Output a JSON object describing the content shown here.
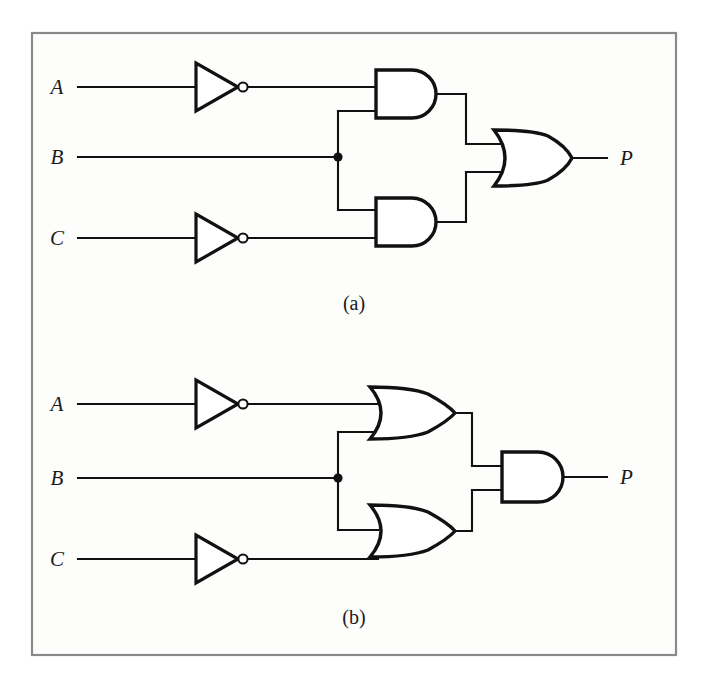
{
  "figure": {
    "background_color": "#ffffff",
    "frame_color": "#8a8a8a",
    "wire_color": "#111111",
    "gate_fill": "#ffffff"
  },
  "circuits": [
    {
      "id": "circuit-a",
      "caption": "(a)",
      "description": "Two AND gates feeding an OR gate",
      "inputs": [
        {
          "label": "A",
          "inverted": true
        },
        {
          "label": "B",
          "inverted": false
        },
        {
          "label": "C",
          "inverted": true
        }
      ],
      "output": {
        "label": "P"
      },
      "gates": [
        {
          "type": "NOT",
          "name": "inverter-a",
          "input": "A",
          "output": "not-A"
        },
        {
          "type": "NOT",
          "name": "inverter-c",
          "input": "C",
          "output": "not-C"
        },
        {
          "type": "AND",
          "name": "and-gate-top",
          "inputs": [
            "not-A",
            "B"
          ]
        },
        {
          "type": "AND",
          "name": "and-gate-bottom",
          "inputs": [
            "B",
            "not-C"
          ]
        },
        {
          "type": "OR",
          "name": "or-gate-output",
          "inputs": [
            "and-gate-top",
            "and-gate-bottom"
          ],
          "output": "P"
        }
      ],
      "expression": "P = (A' · B) + (B · C')"
    },
    {
      "id": "circuit-b",
      "caption": "(b)",
      "description": "Two OR gates feeding an AND gate",
      "inputs": [
        {
          "label": "A",
          "inverted": true
        },
        {
          "label": "B",
          "inverted": false
        },
        {
          "label": "C",
          "inverted": true
        }
      ],
      "output": {
        "label": "P"
      },
      "gates": [
        {
          "type": "NOT",
          "name": "inverter-a",
          "input": "A",
          "output": "not-A"
        },
        {
          "type": "NOT",
          "name": "inverter-c",
          "input": "C",
          "output": "not-C"
        },
        {
          "type": "OR",
          "name": "or-gate-top",
          "inputs": [
            "not-A",
            "B"
          ]
        },
        {
          "type": "OR",
          "name": "or-gate-bottom",
          "inputs": [
            "B",
            "not-C"
          ]
        },
        {
          "type": "AND",
          "name": "and-gate-output",
          "inputs": [
            "or-gate-top",
            "or-gate-bottom"
          ],
          "output": "P"
        }
      ],
      "expression": "P = (A' + B) · (B + C')"
    }
  ],
  "labels": {
    "a_input_a": "A",
    "a_input_b": "B",
    "a_input_c": "C",
    "a_output_p": "P",
    "a_caption": "(a)",
    "b_input_a": "A",
    "b_input_b": "B",
    "b_input_c": "C",
    "b_output_p": "P",
    "b_caption": "(b)"
  }
}
